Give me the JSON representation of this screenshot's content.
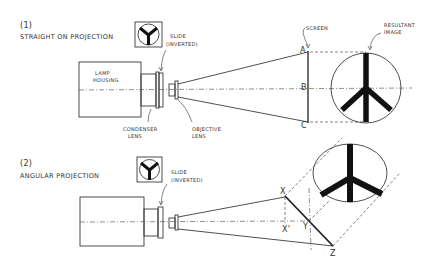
{
  "diagram1": {
    "number": "(1)",
    "title": "STRAIGHT ON PROJECTION",
    "labels": {
      "slide_line1": "SLIDE",
      "slide_line2": "(INVERTED)",
      "lamp_line1": "LAMP",
      "lamp_line2": "HOUSING",
      "condenser_line1": "CONDENSER",
      "condenser_line2": "LENS",
      "objective_line1": "OBJECTIVE",
      "objective_line2": "LENS",
      "screen": "SCREEN",
      "result_line1": "RESULTANT",
      "result_line2": "IMAGE"
    },
    "points": {
      "a": "A",
      "b": "B",
      "c": "C"
    }
  },
  "diagram2": {
    "number": "(2)",
    "title": "ANGULAR PROJECTION",
    "labels": {
      "slide_line1": "SLIDE",
      "slide_line2": "(INVERTED)"
    },
    "points": {
      "x": "X",
      "x_prime": "X'",
      "y": "Y",
      "z": "Z"
    }
  },
  "colors": {
    "ink": "#222222",
    "background": "#ffffff"
  }
}
